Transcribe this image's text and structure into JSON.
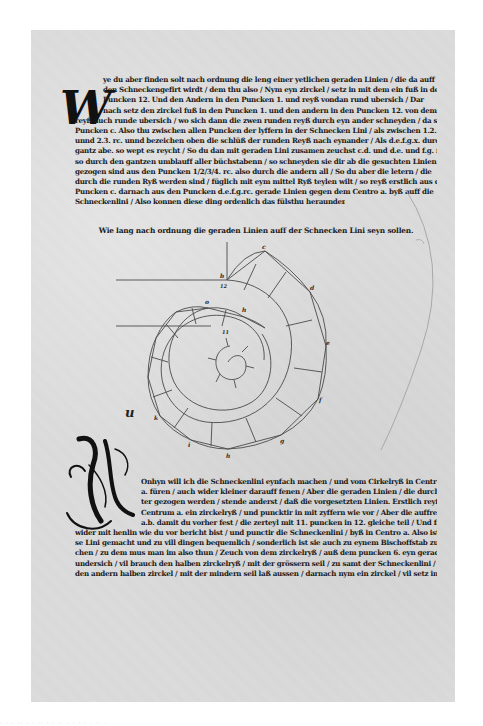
{
  "document": {
    "type": "early printed book page (German blackletter, geometry treatise)",
    "page_color": "#dcdcdc",
    "ink_color": "#1a1a1a",
    "background_color": "#ffffff"
  },
  "top_section": {
    "initial_letter": "W",
    "lines": [
      "ye du aber finden solt nach ordnung die leng einer yetlichen geraden Linien / die da auff",
      "den Schneckengefirt wirdt / dem thu also / Nym eyn zirckel / setz in mit dem ein fuß in den",
      "Puncken 12. Und den Andern in den Puncken 1. und reyß vondan rund ubersich / Dar",
      "nach setz den zirckel fuß in den Puncken 1. und den andern in den Puncken 12. von dem",
      "reyß auch runde ubersich / wo sich dann die zwen runden reyß durch eyn ander schneyden / da setz eynn",
      "Puncken c. Also thu zwischen allen Puncken der lyffern in der Schnecken Lini / als zwischen 1.2.",
      "unnd 2.3. rc. unnd bezeichen oben die schlüß der runden Reyß nach eynander / Als d.e.f.g.x. durchs",
      "gantz abe. so wept es reycht / So du dan mit geraden Lini zusamen zeuchst c.d. und d.e. und f.g. rc. als",
      "so durch den gantzen umblauff aller büchstabenn / so schneyden sie dir ab die gesuchten Linien die da",
      "gezogen sind aus den Puncken 1/2/3/4. rc. also durch die andern all / So du aber die letern / die",
      "durch die runden Ryß werden sind / füglich mit eym mittel Ryß teylen wilt / so reyß erstlich aus dem",
      "Puncken c. darnach aus den Puncken d.e.f.g.rc. gerade Linien gegen dem Centro a. byß auff die",
      "Schneckenlini / Also konnen diese ding ordenlich das fülsthu heraunden auffgerissen."
    ]
  },
  "heading": "Wie lang nach ordnung die geraden Linien auff der Schnecken Lini seyn sollen.",
  "diagram": {
    "labels_outer": [
      "b",
      "12",
      "c",
      "d",
      "e",
      "f",
      "g",
      "h",
      "i",
      "k"
    ],
    "labels_inner": [
      "o",
      "h",
      "11"
    ],
    "marginal_mark": "u"
  },
  "bottom_section": {
    "initial_letter": "N",
    "lines": [
      "Onhyn will ich die Schneckenlini eynfach machen / und vom Cirkelryß in Centrü",
      "a. füren / auch wider kleiner darauff fenen / Aber die geraden Linien / die durch die klei",
      "ter gezogen werden / stende anderst / daß die vorgesetzten Linien. Erstlich reyß aus dem",
      "Centrum a. ein zirckelryß / und puncktir in mit zyffern wie vor / Aber die auffrecht Lini",
      "a.b. damit du vorher fest / die zerteyl mit 11. puncken in 12. gleiche teil / Und far dann",
      "wider mit henlin wie du vor bericht bist / und punctir die Schneckenlini / byß in Centro a. Also ist die",
      "se Lini gemacht und zu vill dingen bequemlich / sonderlich ist sie auch zu eynem Bischoffstab zu brau",
      "chen / zu dem mus man im also thun / Zeuch von dem zirckelryß / auß dem puncken 6. eyn gerade Lini",
      "undersich / vil brauch den halben zirckelryß / mit der grössern seil / zu samt der Schneckenlini / Aber",
      "den andern halben zirckel / mit der mindern seil laß aussen / darnach nym ein zirckel / vil setz in un. dem"
    ]
  },
  "footer_cutoff_text": "· · ·   ·· · · ·· · · ·· ·  · · · · ·· ·"
}
